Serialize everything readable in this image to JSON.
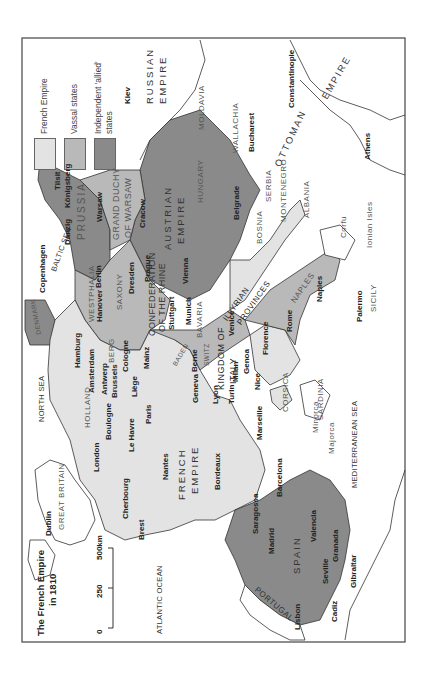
{
  "map": {
    "title_line1": "The French Empire",
    "title_line2": "in 1810",
    "scale": {
      "ticks": [
        "0",
        "250",
        "500km"
      ]
    },
    "legend": [
      {
        "label": "French Empire",
        "color": "#e3e3e3"
      },
      {
        "label": "Vassal states",
        "color": "#b9b9b9"
      },
      {
        "label": "Independent 'allied'",
        "label2": "states",
        "color": "#8a8a8a"
      }
    ],
    "colors": {
      "french": "#e3e3e3",
      "vassal": "#b9b9b9",
      "allied": "#8a8a8a",
      "land": "#ffffff",
      "border": "#333333"
    },
    "regions": {
      "russian_empire_1": "RUSSIAN",
      "russian_empire_2": "EMPIRE",
      "ottoman": "OTTOMAN",
      "ottoman_empire": "EMPIRE",
      "austrian_1": "AUSTRIAN",
      "austrian_2": "EMPIRE",
      "warsaw_1": "GRAND DUCHY",
      "warsaw_2": "OF WARSAW",
      "prussia": "PRUSSIA",
      "confed_1": "CONFEDERATION",
      "confed_2": "OF THE RHINE",
      "french_1": "FRENCH",
      "french_2": "EMPIRE",
      "spain": "SPAIN",
      "portugal": "PORTUGAL",
      "great_britain": "GREAT BRITAIN",
      "italy_1": "KINGDOM OF",
      "italy_2": "ITALY",
      "illyrian_1": "ILLYRIAN",
      "illyrian_2": "PROVINCES",
      "naples": "NAPLES",
      "moldavia": "MOLDAVIA",
      "wallachia": "WALLACHIA",
      "hungary": "HUNGARY",
      "serbia": "SERBIA",
      "montenegro": "MONTENEGRO",
      "albania": "ALBANIA",
      "bosnia": "BOSNIA",
      "sardinia": "SARDINIA",
      "corsica": "CORSICA",
      "sicily": "SICILY",
      "holland": "HOLLAND",
      "westphalia": "WESTPHALIA",
      "berg": "BERG",
      "saxony": "SAXONY",
      "bavaria": "BAVARIA",
      "baden": "BADEN",
      "switz": "SWITZ",
      "denmark": "DENMARK",
      "ionian": "Ionian Isles",
      "minorca": "Minorca",
      "majorca": "Majorca",
      "corfu": "Corfu"
    },
    "seas": {
      "north_sea": "NORTH SEA",
      "baltic_sea": "BALTIC SEA",
      "atlantic": "ATLANTIC OCEAN",
      "mediterranean": "MEDITERRANEAN SEA"
    },
    "cities": {
      "kiev": "Kiev",
      "constantinople": "Constantinople",
      "bucharest": "Bucharest",
      "athens": "Athens",
      "belgrade": "Belgrade",
      "tilsit": "Tilsit",
      "konigsberg": "Königsberg",
      "warsaw": "Warsaw",
      "cracow": "Cracow",
      "danzig": "Danzig",
      "copenhagen": "Copenhagen",
      "berlin": "Berlin",
      "hanover": "Hanover",
      "dresden": "Dresden",
      "prague": "Prague",
      "vienna": "Vienna",
      "hamburg": "Hamburg",
      "amsterdam": "Amsterdam",
      "antwerp": "Antwerp",
      "brussels": "Brussels",
      "cologne": "Cologne",
      "liege": "Liège",
      "mainz": "Mainz",
      "stuttgart": "Stuttgart",
      "munich": "Munich",
      "berne": "Berne",
      "geneva": "Geneva",
      "lyon": "Lyon",
      "turin": "Turin",
      "milan": "Milan",
      "genoa": "Genoa",
      "venice": "Venice",
      "florence": "Florence",
      "rome": "Rome",
      "naples_city": "Naples",
      "palermo": "Palermo",
      "nice": "Nice",
      "marseille": "Marseille",
      "paris": "Paris",
      "le_havre": "Le Havre",
      "boulogne": "Boulogne",
      "london": "London",
      "dublin": "Dublin",
      "cherbourg": "Cherbourg",
      "brest": "Brest",
      "nantes": "Nantes",
      "bordeaux": "Bordeaux",
      "barcelona": "Barcelona",
      "saragossa": "Saragossa",
      "madrid": "Madrid",
      "valencia": "Valencia",
      "granada": "Granada",
      "seville": "Seville",
      "gibraltar": "Gibraltar",
      "cadiz": "Cadiz",
      "lisbon": "Lisbon"
    }
  }
}
